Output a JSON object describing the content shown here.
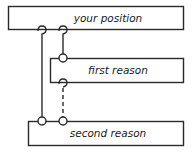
{
  "diagram": {
    "boxes": [
      {
        "id": "position",
        "label": "your position"
      },
      {
        "id": "first",
        "label": "first reason"
      },
      {
        "id": "second",
        "label": "second reason"
      }
    ],
    "connectors": [
      {
        "from": "position",
        "to": "second",
        "style": "solid"
      },
      {
        "from": "position",
        "to": "first",
        "style": "solid"
      },
      {
        "from": "first",
        "to": "second",
        "style": "dashed"
      }
    ],
    "colors": {
      "stroke": "#2a2a2a",
      "background": "#ffffff"
    }
  }
}
